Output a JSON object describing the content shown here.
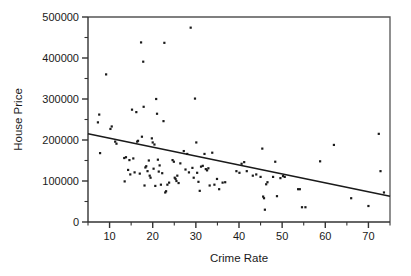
{
  "chart_data": {
    "type": "scatter",
    "title": "",
    "xlabel": "Crime Rate",
    "ylabel": "House Price",
    "xlim": [
      5,
      75
    ],
    "ylim": [
      0,
      500000
    ],
    "grid": false,
    "legend": false,
    "x_ticks": [
      10,
      20,
      30,
      40,
      50,
      60,
      70
    ],
    "x_tick_labels": [
      "10",
      "20",
      "30",
      "40",
      "50",
      "60",
      "70"
    ],
    "x_minor_ticks": [
      5,
      15,
      25,
      35,
      45,
      55,
      65,
      75
    ],
    "y_ticks": [
      0,
      100000,
      200000,
      300000,
      400000,
      500000
    ],
    "y_tick_labels": [
      "0",
      "100000",
      "200000",
      "300000",
      "400000",
      "500000"
    ],
    "y_minor_ticks": [
      50000,
      150000,
      250000,
      350000,
      450000
    ],
    "marker": "square",
    "marker_size": 2.2,
    "marker_color": "#1a1a1a",
    "trend_line": {
      "type": "linear-fit",
      "color": "#1a1a1a",
      "x_start": 5,
      "y_start": 215000,
      "x_end": 75,
      "y_end": 63000
    },
    "points": [
      [
        7.3,
        243000
      ],
      [
        7.6,
        262000
      ],
      [
        7.8,
        168000
      ],
      [
        9.2,
        360000
      ],
      [
        10.2,
        227000
      ],
      [
        10.5,
        233000
      ],
      [
        11.3,
        196000
      ],
      [
        11.6,
        191000
      ],
      [
        13.4,
        156000
      ],
      [
        13.5,
        99000
      ],
      [
        13.8,
        158000
      ],
      [
        14.3,
        127000
      ],
      [
        14.6,
        151000
      ],
      [
        14.8,
        116000
      ],
      [
        15.2,
        274000
      ],
      [
        15.5,
        155000
      ],
      [
        15.8,
        121000
      ],
      [
        16.2,
        268000
      ],
      [
        16.4,
        196000
      ],
      [
        16.6,
        198000
      ],
      [
        17.0,
        118000
      ],
      [
        17.3,
        438000
      ],
      [
        17.5,
        208000
      ],
      [
        17.8,
        391000
      ],
      [
        17.9,
        281000
      ],
      [
        18.1,
        89000
      ],
      [
        18.3,
        133000
      ],
      [
        18.5,
        136000
      ],
      [
        18.8,
        124000
      ],
      [
        19.1,
        150000
      ],
      [
        19.3,
        113000
      ],
      [
        19.5,
        108000
      ],
      [
        19.8,
        204000
      ],
      [
        20.0,
        194000
      ],
      [
        20.2,
        130000
      ],
      [
        20.4,
        189000
      ],
      [
        20.6,
        88000
      ],
      [
        20.8,
        300000
      ],
      [
        21.0,
        264000
      ],
      [
        21.2,
        152000
      ],
      [
        21.4,
        123000
      ],
      [
        21.6,
        138000
      ],
      [
        21.9,
        91000
      ],
      [
        22.2,
        119000
      ],
      [
        22.5,
        246000
      ],
      [
        22.7,
        437000
      ],
      [
        22.9,
        72000
      ],
      [
        23.1,
        75000
      ],
      [
        23.4,
        91000
      ],
      [
        23.8,
        96000
      ],
      [
        24.6,
        151000
      ],
      [
        24.9,
        147000
      ],
      [
        25.1,
        108000
      ],
      [
        25.3,
        105000
      ],
      [
        25.5,
        100000
      ],
      [
        25.7,
        113000
      ],
      [
        26.0,
        95000
      ],
      [
        26.4,
        143000
      ],
      [
        27.2,
        173000
      ],
      [
        27.6,
        128000
      ],
      [
        28.0,
        166000
      ],
      [
        28.4,
        121000
      ],
      [
        28.8,
        474000
      ],
      [
        29.2,
        132000
      ],
      [
        29.5,
        108000
      ],
      [
        29.8,
        301000
      ],
      [
        30.1,
        194000
      ],
      [
        30.3,
        120000
      ],
      [
        30.6,
        98000
      ],
      [
        30.9,
        76000
      ],
      [
        31.2,
        135000
      ],
      [
        31.6,
        137000
      ],
      [
        32.0,
        166000
      ],
      [
        32.3,
        129000
      ],
      [
        32.6,
        126000
      ],
      [
        32.9,
        131000
      ],
      [
        33.2,
        89000
      ],
      [
        33.8,
        169000
      ],
      [
        34.3,
        91000
      ],
      [
        34.9,
        105000
      ],
      [
        35.4,
        80000
      ],
      [
        36.2,
        96000
      ],
      [
        36.8,
        97000
      ],
      [
        39.4,
        124000
      ],
      [
        40.1,
        120000
      ],
      [
        40.6,
        142000
      ],
      [
        41.2,
        146000
      ],
      [
        41.8,
        124000
      ],
      [
        43.2,
        113000
      ],
      [
        44.0,
        116000
      ],
      [
        45.0,
        110000
      ],
      [
        45.4,
        179000
      ],
      [
        45.6,
        62000
      ],
      [
        45.8,
        58000
      ],
      [
        46.0,
        30000
      ],
      [
        46.3,
        92000
      ],
      [
        46.6,
        97000
      ],
      [
        47.9,
        110000
      ],
      [
        48.4,
        147000
      ],
      [
        48.8,
        63000
      ],
      [
        49.6,
        107000
      ],
      [
        50.2,
        112000
      ],
      [
        50.6,
        110000
      ],
      [
        53.7,
        80000
      ],
      [
        54.1,
        80000
      ],
      [
        54.6,
        36000
      ],
      [
        55.4,
        36000
      ],
      [
        58.8,
        148000
      ],
      [
        62.0,
        188000
      ],
      [
        66.0,
        58000
      ],
      [
        70.0,
        39000
      ],
      [
        72.4,
        215000
      ],
      [
        72.8,
        124000
      ],
      [
        73.6,
        72000
      ]
    ]
  }
}
